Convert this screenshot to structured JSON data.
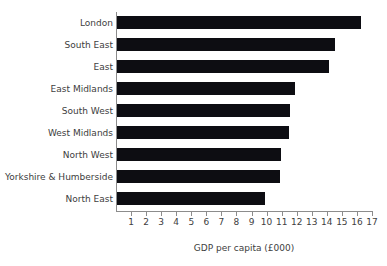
{
  "chart_data": {
    "type": "bar",
    "orientation": "horizontal",
    "title": "",
    "xlabel": "GDP per capita (£000)",
    "ylabel": "",
    "xlim": [
      0,
      17
    ],
    "xticks": [
      1,
      2,
      3,
      4,
      5,
      6,
      7,
      8,
      9,
      10,
      11,
      12,
      13,
      14,
      15,
      16,
      17
    ],
    "grid": false,
    "legend": null,
    "bar_color": "#0d0d12",
    "axis_color": "#8c8c8c",
    "categories": [
      "London",
      "South East",
      "East",
      "East Midlands",
      "South West",
      "West Midlands",
      "North West",
      "Yorkshire & Humberside",
      "North East"
    ],
    "values": [
      16.2,
      14.5,
      14.1,
      11.8,
      11.5,
      11.4,
      10.9,
      10.8,
      9.8
    ]
  }
}
